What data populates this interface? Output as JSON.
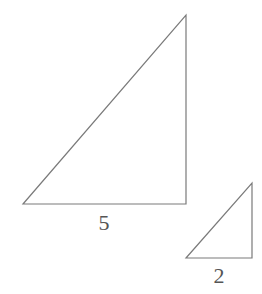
{
  "diagram": {
    "stroke_color": "#7a7a7a",
    "label_color": "#555555",
    "triangles": [
      {
        "name": "large-triangle",
        "points": "23,204 186,15 186,204",
        "base_label": "5",
        "label_x": 104,
        "label_y": 212
      },
      {
        "name": "small-triangle",
        "points": "186,258 252,183 252,258",
        "base_label": "2",
        "label_x": 219,
        "label_y": 265
      }
    ]
  }
}
